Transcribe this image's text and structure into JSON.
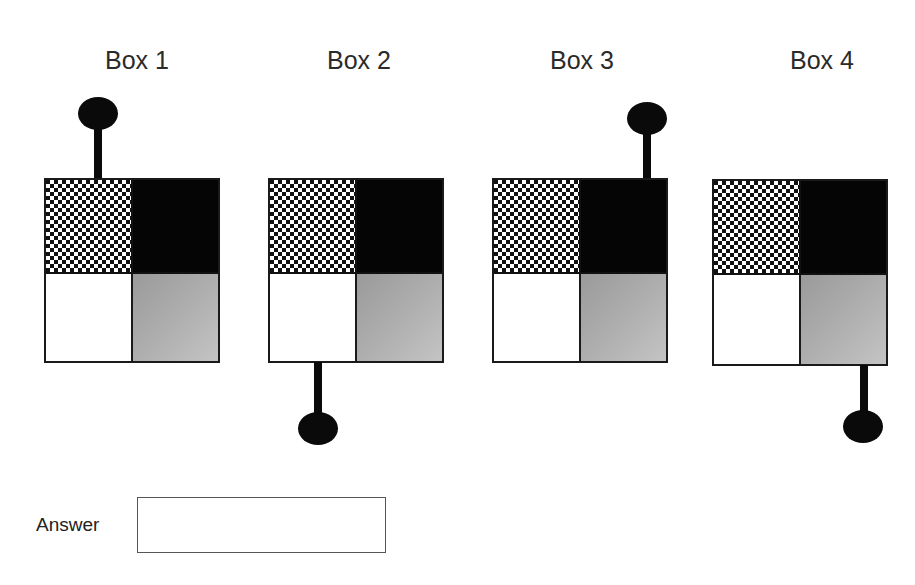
{
  "boxes": [
    {
      "label": "Box 1",
      "knob_position": "top-left"
    },
    {
      "label": "Box 2",
      "knob_position": "bottom-left"
    },
    {
      "label": "Box 3",
      "knob_position": "top-right"
    },
    {
      "label": "Box 4",
      "knob_position": "bottom-right"
    }
  ],
  "box_quadrants": {
    "top_left": "checkerboard",
    "top_right": "black",
    "bottom_left": "white",
    "bottom_right": "gray"
  },
  "answer": {
    "label": "Answer",
    "value": "",
    "placeholder": ""
  }
}
